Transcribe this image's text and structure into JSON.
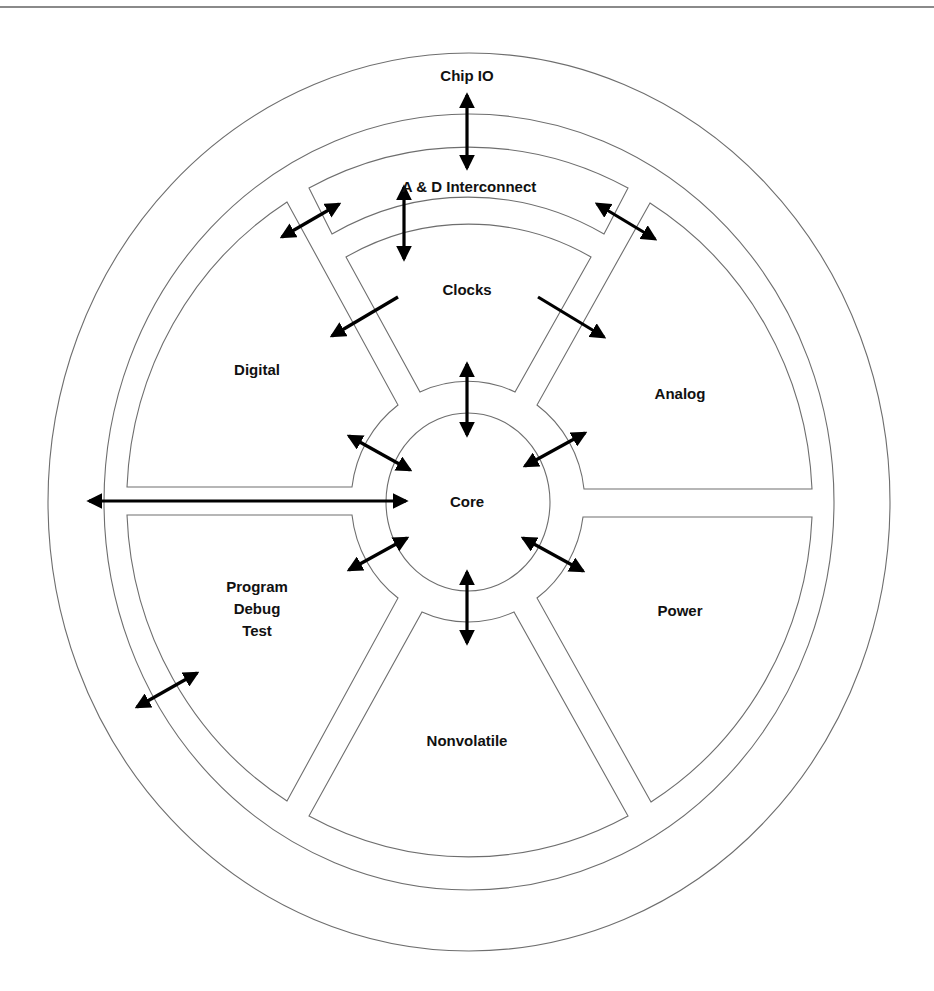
{
  "diagram": {
    "type": "block-diagram",
    "center_block": "Core",
    "labels": {
      "chip_io": "Chip IO",
      "interconnect": "A & D Interconnect",
      "clocks": "Clocks",
      "digital": "Digital",
      "analog": "Analog",
      "core": "Core",
      "program": [
        "Program",
        "Debug",
        "Test"
      ],
      "power": "Power",
      "nonvolatile": "Nonvolatile"
    },
    "colors": {
      "outline": "#6e6e6e",
      "arrow": "#000000",
      "text": "#111111",
      "background": "#ffffff",
      "top_rule": "#8a8a8a"
    },
    "connections": [
      {
        "from": "Chip IO",
        "to": "A & D Interconnect",
        "bidirectional": true
      },
      {
        "from": "A & D Interconnect",
        "to": "Clocks",
        "bidirectional": true
      },
      {
        "from": "A & D Interconnect",
        "to": "Digital",
        "bidirectional": true
      },
      {
        "from": "A & D Interconnect",
        "to": "Analog",
        "bidirectional": true
      },
      {
        "from": "Clocks",
        "to": "Digital",
        "bidirectional": false
      },
      {
        "from": "Clocks",
        "to": "Analog",
        "bidirectional": false
      },
      {
        "from": "Core",
        "to": "Clocks",
        "bidirectional": true
      },
      {
        "from": "Core",
        "to": "Digital",
        "bidirectional": true
      },
      {
        "from": "Core",
        "to": "Analog",
        "bidirectional": true
      },
      {
        "from": "Core",
        "to": "Program Debug Test",
        "bidirectional": true
      },
      {
        "from": "Core",
        "to": "Power",
        "bidirectional": true
      },
      {
        "from": "Core",
        "to": "Nonvolatile",
        "bidirectional": true
      },
      {
        "from": "Core",
        "to": "Chip IO",
        "bidirectional": true
      },
      {
        "from": "Program Debug Test",
        "to": "Chip IO",
        "bidirectional": true
      }
    ]
  }
}
